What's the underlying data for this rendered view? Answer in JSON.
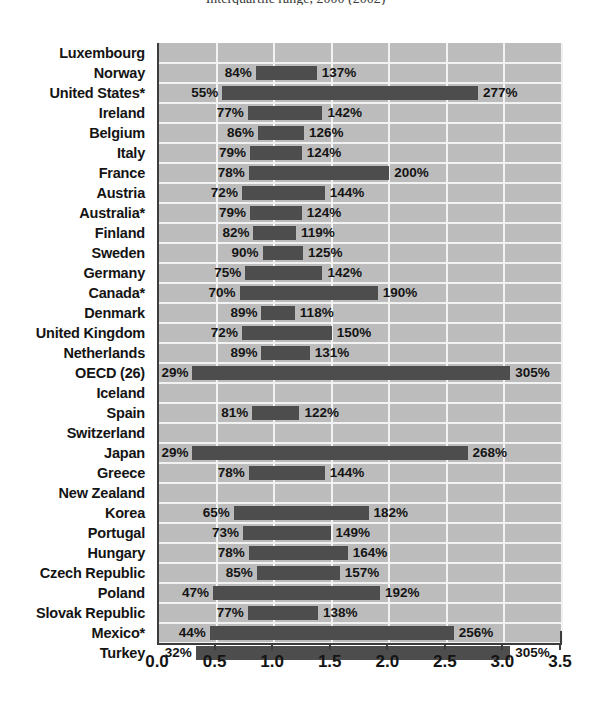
{
  "chart_data": {
    "type": "bar",
    "title": "Interquartile range, 2000 (2002)",
    "xlabel": "",
    "ylabel": "",
    "xlim": [
      0.0,
      3.5
    ],
    "xticks": [
      "0.0",
      "0.5",
      "1.0",
      "1.5",
      "2.0",
      "2.5",
      "3.0",
      "3.5"
    ],
    "xtick_values": [
      0.0,
      0.5,
      1.0,
      1.5,
      2.0,
      2.5,
      3.0,
      3.5
    ],
    "grid": true,
    "legend": "none",
    "orientation": "horizontal",
    "bar_style": "floating-range",
    "categories": [
      "Luxembourg",
      "Norway",
      "United States*",
      "Ireland",
      "Belgium",
      "Italy",
      "France",
      "Austria",
      "Australia*",
      "Finland",
      "Sweden",
      "Germany",
      "Canada*",
      "Denmark",
      "United Kingdom",
      "Netherlands",
      "OECD (26)",
      "Iceland",
      "Spain",
      "Switzerland",
      "Japan",
      "Greece",
      "New Zealand",
      "Korea",
      "Portugal",
      "Hungary",
      "Czech Republic",
      "Poland",
      "Slovak Republic",
      "Mexico*",
      "Turkey"
    ],
    "rows": [
      {
        "category": "Luxembourg",
        "low": null,
        "high": null,
        "low_label": "",
        "high_label": ""
      },
      {
        "category": "Norway",
        "low": 0.84,
        "high": 1.37,
        "low_label": "84%",
        "high_label": "137%"
      },
      {
        "category": "United States*",
        "low": 0.55,
        "high": 2.77,
        "low_label": "55%",
        "high_label": "277%"
      },
      {
        "category": "Ireland",
        "low": 0.77,
        "high": 1.42,
        "low_label": "77%",
        "high_label": "142%"
      },
      {
        "category": "Belgium",
        "low": 0.86,
        "high": 1.26,
        "low_label": "86%",
        "high_label": "126%"
      },
      {
        "category": "Italy",
        "low": 0.79,
        "high": 1.24,
        "low_label": "79%",
        "high_label": "124%"
      },
      {
        "category": "France",
        "low": 0.78,
        "high": 2.0,
        "low_label": "78%",
        "high_label": "200%"
      },
      {
        "category": "Austria",
        "low": 0.72,
        "high": 1.44,
        "low_label": "72%",
        "high_label": "144%"
      },
      {
        "category": "Australia*",
        "low": 0.79,
        "high": 1.24,
        "low_label": "79%",
        "high_label": "124%"
      },
      {
        "category": "Finland",
        "low": 0.82,
        "high": 1.19,
        "low_label": "82%",
        "high_label": "119%"
      },
      {
        "category": "Sweden",
        "low": 0.9,
        "high": 1.25,
        "low_label": "90%",
        "high_label": "125%"
      },
      {
        "category": "Germany",
        "low": 0.75,
        "high": 1.42,
        "low_label": "75%",
        "high_label": "142%"
      },
      {
        "category": "Canada*",
        "low": 0.7,
        "high": 1.9,
        "low_label": "70%",
        "high_label": "190%"
      },
      {
        "category": "Denmark",
        "low": 0.89,
        "high": 1.18,
        "low_label": "89%",
        "high_label": "118%"
      },
      {
        "category": "United Kingdom",
        "low": 0.72,
        "high": 1.5,
        "low_label": "72%",
        "high_label": "150%"
      },
      {
        "category": "Netherlands",
        "low": 0.89,
        "high": 1.31,
        "low_label": "89%",
        "high_label": "131%"
      },
      {
        "category": "OECD (26)",
        "low": 0.29,
        "high": 3.05,
        "low_label": "29%",
        "high_label": "305%"
      },
      {
        "category": "Iceland",
        "low": null,
        "high": null,
        "low_label": "",
        "high_label": ""
      },
      {
        "category": "Spain",
        "low": 0.81,
        "high": 1.22,
        "low_label": "81%",
        "high_label": "122%"
      },
      {
        "category": "Switzerland",
        "low": null,
        "high": null,
        "low_label": "",
        "high_label": ""
      },
      {
        "category": "Japan",
        "low": 0.29,
        "high": 2.68,
        "low_label": "29%",
        "high_label": "268%"
      },
      {
        "category": "Greece",
        "low": 0.78,
        "high": 1.44,
        "low_label": "78%",
        "high_label": "144%"
      },
      {
        "category": "New Zealand",
        "low": null,
        "high": null,
        "low_label": "",
        "high_label": ""
      },
      {
        "category": "Korea",
        "low": 0.65,
        "high": 1.82,
        "low_label": "65%",
        "high_label": "182%"
      },
      {
        "category": "Portugal",
        "low": 0.73,
        "high": 1.49,
        "low_label": "73%",
        "high_label": "149%"
      },
      {
        "category": "Hungary",
        "low": 0.78,
        "high": 1.64,
        "low_label": "78%",
        "high_label": "164%"
      },
      {
        "category": "Czech Republic",
        "low": 0.85,
        "high": 1.57,
        "low_label": "85%",
        "high_label": "157%"
      },
      {
        "category": "Poland",
        "low": 0.47,
        "high": 1.92,
        "low_label": "47%",
        "high_label": "192%"
      },
      {
        "category": "Slovak Republic",
        "low": 0.77,
        "high": 1.38,
        "low_label": "77%",
        "high_label": "138%"
      },
      {
        "category": "Mexico*",
        "low": 0.44,
        "high": 2.56,
        "low_label": "44%",
        "high_label": "256%"
      },
      {
        "category": "Turkey",
        "low": 0.32,
        "high": 3.05,
        "low_label": "32%",
        "high_label": "305%"
      }
    ]
  },
  "colors": {
    "bar": "#4d4d4d",
    "plot_background": "#bcbcbc",
    "gridline": "#f2f2f2",
    "axis": "#3c3c3c",
    "text": "#141414",
    "page_background": "#ffffff"
  }
}
